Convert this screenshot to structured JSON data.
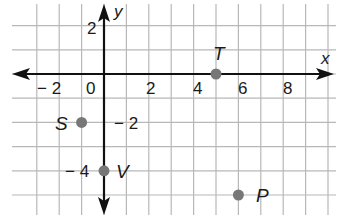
{
  "plane": {
    "x_axis_label": "x",
    "y_axis_label": "y",
    "x_ticks": [
      {
        "value": -2,
        "label": "− 2"
      },
      {
        "value": 0,
        "label": "0"
      },
      {
        "value": 2,
        "label": "2"
      },
      {
        "value": 4,
        "label": "4"
      },
      {
        "value": 6,
        "label": "6"
      },
      {
        "value": 8,
        "label": "8"
      }
    ],
    "y_ticks": [
      {
        "value": 2,
        "label": "2"
      },
      {
        "value": -2,
        "label": "− 2"
      },
      {
        "value": -4,
        "label": "− 4"
      }
    ],
    "grid_x_range": [
      -3,
      10
    ],
    "grid_y_range": [
      -5,
      2
    ],
    "grid_color": "#b8b8b8",
    "axis_color": "#111111",
    "point_color": "#777777"
  },
  "points": [
    {
      "name": "T",
      "x": 5,
      "y": 0
    },
    {
      "name": "S",
      "x": -1,
      "y": -2
    },
    {
      "name": "V",
      "x": 0,
      "y": -4
    },
    {
      "name": "P",
      "x": 6,
      "y": -5
    }
  ]
}
